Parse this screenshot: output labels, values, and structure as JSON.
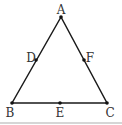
{
  "diagram": {
    "type": "triangle",
    "vertices": [
      {
        "id": "A",
        "label": "A",
        "x": 61,
        "y": 17
      },
      {
        "id": "B",
        "label": "B",
        "x": 12,
        "y": 103
      },
      {
        "id": "C",
        "label": "C",
        "x": 107,
        "y": 103
      }
    ],
    "midpoints": [
      {
        "id": "D",
        "label": "D",
        "on": "AB",
        "x": 36,
        "y": 60
      },
      {
        "id": "E",
        "label": "E",
        "on": "BC",
        "x": 60,
        "y": 103
      },
      {
        "id": "F",
        "label": "F",
        "on": "AC",
        "x": 84,
        "y": 60
      }
    ],
    "edges": [
      "AB",
      "BC",
      "CA"
    ],
    "colors": {
      "line": "#1a1a1a",
      "label": "#333333",
      "footer_rule": "#d6d6d6"
    }
  },
  "labels": {
    "A": "A",
    "B": "B",
    "C": "C",
    "D": "D",
    "E": "E",
    "F": "F"
  }
}
